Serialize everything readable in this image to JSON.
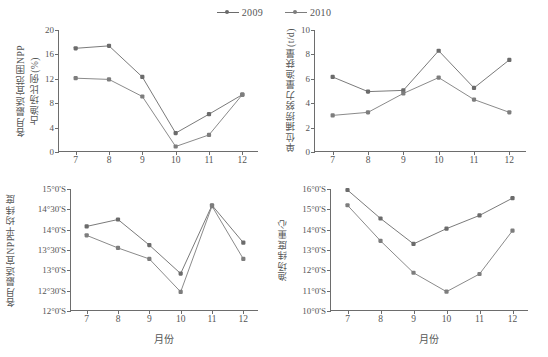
{
  "legend": {
    "position": "top-center",
    "entries": [
      {
        "label": "2009",
        "color": "#6b6b6b"
      },
      {
        "label": "2010",
        "color": "#6b6b6b"
      }
    ]
  },
  "chart_data": [
    {
      "id": "panel-top-left",
      "type": "line",
      "title": "",
      "xlabel": "",
      "ylabel": "各月最适宜范围NPP占渔场比例(%)",
      "ylabel_lines": [
        "各月最适宜范围NPP",
        "占渔场比例(%)"
      ],
      "categories": [
        "7",
        "8",
        "9",
        "10",
        "11",
        "12"
      ],
      "x": [
        7,
        8,
        9,
        10,
        11,
        12
      ],
      "xlim": [
        6.5,
        12.5
      ],
      "ylim": [
        0,
        20
      ],
      "yticks": [
        0,
        4,
        8,
        12,
        16,
        20
      ],
      "ytick_labels": [
        "0",
        "4",
        "8",
        "12",
        "16",
        "20"
      ],
      "grid": false,
      "series": [
        {
          "name": "2009",
          "color": "#6b6b6b",
          "values": [
            17.0,
            17.4,
            12.3,
            3.1,
            6.2,
            9.4
          ]
        },
        {
          "name": "2010",
          "color": "#7d7d7d",
          "values": [
            12.1,
            11.9,
            9.1,
            0.9,
            2.8,
            9.4
          ]
        }
      ]
    },
    {
      "id": "panel-top-right",
      "type": "line",
      "title": "",
      "xlabel": "",
      "ylabel": "单位捕捞努力量渔获量(t/d)",
      "ylabel_lines": [
        "单位捕捞努力量渔获量(t/d)"
      ],
      "categories": [
        "7",
        "8",
        "9",
        "10",
        "11",
        "12"
      ],
      "x": [
        7,
        8,
        9,
        10,
        11,
        12
      ],
      "xlim": [
        6.5,
        12.5
      ],
      "ylim": [
        0,
        10
      ],
      "yticks": [
        0,
        2,
        4,
        6,
        8,
        10
      ],
      "ytick_labels": [
        "0",
        "2",
        "4",
        "6",
        "8",
        "10"
      ],
      "grid": false,
      "series": [
        {
          "name": "2009",
          "color": "#6b6b6b",
          "values": [
            6.15,
            4.95,
            5.05,
            8.3,
            5.25,
            7.55
          ]
        },
        {
          "name": "2010",
          "color": "#7d7d7d",
          "values": [
            3.0,
            3.25,
            4.8,
            6.1,
            4.3,
            3.25
          ]
        }
      ]
    },
    {
      "id": "panel-bottom-left",
      "type": "line",
      "title": "",
      "xlabel": "月份",
      "ylabel": "各月最适宜NPP平均纬度",
      "ylabel_lines": [
        "各月最适宜NPP平均纬度"
      ],
      "categories": [
        "7",
        "8",
        "9",
        "10",
        "11",
        "12"
      ],
      "x": [
        7,
        8,
        9,
        10,
        11,
        12
      ],
      "xlim": [
        6.5,
        12.5
      ],
      "ylim": [
        12.0,
        15.0
      ],
      "yticks": [
        12.0,
        12.5,
        13.0,
        13.5,
        14.0,
        14.5,
        15.0
      ],
      "ytick_labels": [
        "12°0'S",
        "12°30'S",
        "13°0'S",
        "13°30'S",
        "14°0'S",
        "14°30'S",
        "15°0'S"
      ],
      "grid": false,
      "series": [
        {
          "name": "2009",
          "color": "#6b6b6b",
          "values": [
            14.08,
            14.25,
            13.62,
            12.92,
            14.6,
            13.68
          ]
        },
        {
          "name": "2010",
          "color": "#7d7d7d",
          "values": [
            13.86,
            13.55,
            13.28,
            12.47,
            14.58,
            13.28
          ]
        }
      ]
    },
    {
      "id": "panel-bottom-right",
      "type": "line",
      "title": "",
      "xlabel": "月份",
      "ylabel": "渔场纬度重心",
      "ylabel_lines": [
        "渔场纬度重心"
      ],
      "categories": [
        "7",
        "8",
        "9",
        "10",
        "11",
        "12"
      ],
      "x": [
        7,
        8,
        9,
        10,
        11,
        12
      ],
      "xlim": [
        6.5,
        12.5
      ],
      "ylim": [
        10.0,
        16.0
      ],
      "yticks": [
        10,
        11,
        12,
        13,
        14,
        15,
        16
      ],
      "ytick_labels": [
        "10°0'S",
        "11°0'S",
        "12°0'S",
        "13°0'S",
        "14°0'S",
        "15°0'S",
        "16°0'S"
      ],
      "grid": false,
      "series": [
        {
          "name": "2009",
          "color": "#6b6b6b",
          "values": [
            15.95,
            14.55,
            13.3,
            14.05,
            14.7,
            15.55
          ]
        },
        {
          "name": "2010",
          "color": "#7d7d7d",
          "values": [
            15.2,
            13.45,
            11.88,
            10.95,
            11.82,
            13.95
          ]
        }
      ]
    }
  ]
}
